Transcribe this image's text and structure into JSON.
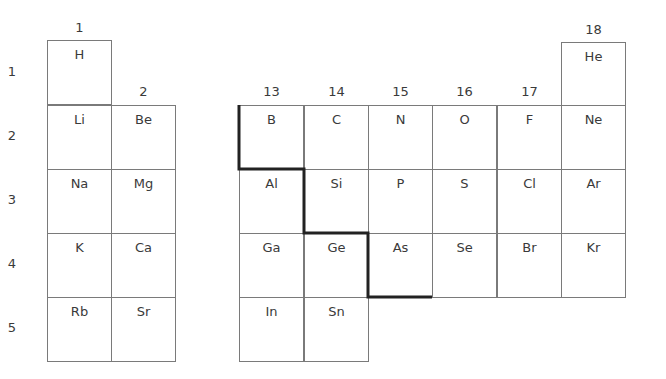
{
  "title": "",
  "groups": [
    {
      "label": "1",
      "x": 47,
      "y": 20
    },
    {
      "label": "2",
      "x": 111,
      "y": 84
    },
    {
      "label": "13",
      "x": 239,
      "y": 84
    },
    {
      "label": "14",
      "x": 304,
      "y": 84
    },
    {
      "label": "15",
      "x": 368,
      "y": 84
    },
    {
      "label": "16",
      "x": 432,
      "y": 84
    },
    {
      "label": "17",
      "x": 497,
      "y": 84
    },
    {
      "label": "18",
      "x": 561,
      "y": 22
    }
  ],
  "periods": [
    {
      "label": "1",
      "y": 64
    },
    {
      "label": "2",
      "y": 128
    },
    {
      "label": "3",
      "y": 192
    },
    {
      "label": "4",
      "y": 256
    },
    {
      "label": "5",
      "y": 320
    }
  ],
  "elements": [
    {
      "symbol": "H",
      "x": 47,
      "y": 40
    },
    {
      "symbol": "He",
      "x": 561,
      "y": 42
    },
    {
      "symbol": "Li",
      "x": 47,
      "y": 105
    },
    {
      "symbol": "Be",
      "x": 111,
      "y": 105
    },
    {
      "symbol": "B",
      "x": 239,
      "y": 105
    },
    {
      "symbol": "C",
      "x": 304,
      "y": 105
    },
    {
      "symbol": "N",
      "x": 368,
      "y": 105
    },
    {
      "symbol": "O",
      "x": 432,
      "y": 105
    },
    {
      "symbol": "F",
      "x": 497,
      "y": 105
    },
    {
      "symbol": "Ne",
      "x": 561,
      "y": 105
    },
    {
      "symbol": "Na",
      "x": 47,
      "y": 169
    },
    {
      "symbol": "Mg",
      "x": 111,
      "y": 169
    },
    {
      "symbol": "Al",
      "x": 239,
      "y": 169
    },
    {
      "symbol": "Si",
      "x": 304,
      "y": 169
    },
    {
      "symbol": "P",
      "x": 368,
      "y": 169
    },
    {
      "symbol": "S",
      "x": 432,
      "y": 169
    },
    {
      "symbol": "Cl",
      "x": 497,
      "y": 169
    },
    {
      "symbol": "Ar",
      "x": 561,
      "y": 169
    },
    {
      "symbol": "K",
      "x": 47,
      "y": 233
    },
    {
      "symbol": "Ca",
      "x": 111,
      "y": 233
    },
    {
      "symbol": "Ga",
      "x": 239,
      "y": 233
    },
    {
      "symbol": "Ge",
      "x": 304,
      "y": 233
    },
    {
      "symbol": "As",
      "x": 368,
      "y": 233
    },
    {
      "symbol": "Se",
      "x": 432,
      "y": 233
    },
    {
      "symbol": "Br",
      "x": 497,
      "y": 233
    },
    {
      "symbol": "Kr",
      "x": 561,
      "y": 233
    },
    {
      "symbol": "Rb",
      "x": 47,
      "y": 297
    },
    {
      "symbol": "Sr",
      "x": 111,
      "y": 297
    },
    {
      "symbol": "In",
      "x": 239,
      "y": 297
    },
    {
      "symbol": "Sn",
      "x": 304,
      "y": 297
    }
  ],
  "metalloid_line": {
    "color": "#222222",
    "points": "239,105 239,169 304,169 304,233 368,233 368,297 432,297"
  }
}
